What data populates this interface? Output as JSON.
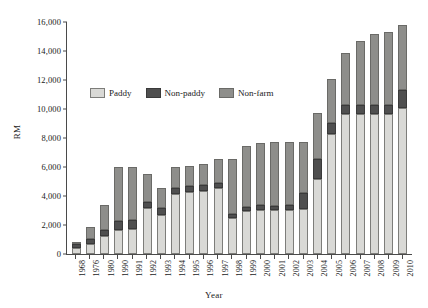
{
  "chart_data": {
    "type": "bar",
    "stacked": true,
    "title": "",
    "xlabel": "Year",
    "ylabel": "RM",
    "ylim": [
      0,
      16000
    ],
    "ytick_step": 2000,
    "yticks": [
      "16,000",
      "14,000",
      "12,000",
      "10,000",
      "8,000",
      "6,000",
      "4,000",
      "2,000",
      "0"
    ],
    "ytick_values": [
      16000,
      14000,
      12000,
      10000,
      8000,
      6000,
      4000,
      2000,
      0
    ],
    "grid": false,
    "legend_position": "upper-left-inside",
    "categories": [
      "1968",
      "1976",
      "1980",
      "1990",
      "1991",
      "1992",
      "1993",
      "1994",
      "1995",
      "1996",
      "1997",
      "1998",
      "1999",
      "2000",
      "2001",
      "2002",
      "2003",
      "2004",
      "2005",
      "2006",
      "2007",
      "2008",
      "2009",
      "2010"
    ],
    "series": [
      {
        "name": "Paddy",
        "color": "#d9d9d6",
        "values": [
          420,
          700,
          1250,
          1650,
          1750,
          3150,
          2650,
          4150,
          4250,
          4300,
          4500,
          2450,
          2950,
          3050,
          3000,
          3050,
          3100,
          5150,
          8250,
          9600,
          9600,
          9600,
          9600,
          10000
        ]
      },
      {
        "name": "Non-paddy",
        "color": "#4f4f4f",
        "values": [
          250,
          300,
          430,
          600,
          600,
          400,
          500,
          400,
          400,
          450,
          350,
          300,
          300,
          350,
          300,
          350,
          1100,
          1350,
          750,
          600,
          600,
          600,
          600,
          1250
        ]
      },
      {
        "name": "Non-farm",
        "color": "#8e8e8b",
        "values": [
          130,
          850,
          1720,
          3750,
          3650,
          1950,
          1350,
          1450,
          1400,
          1450,
          1700,
          3750,
          4150,
          4200,
          4400,
          4300,
          3500,
          3200,
          3000,
          3600,
          4400,
          4900,
          5050,
          4500
        ]
      }
    ],
    "totals": [
      800,
      1850,
      3400,
      6000,
      6000,
      5500,
      4500,
      6000,
      6050,
      6200,
      6550,
      6500,
      7400,
      7600,
      7700,
      7700,
      7700,
      9700,
      12000,
      13800,
      14600,
      15100,
      15250,
      15750
    ]
  },
  "legend": {
    "items": [
      {
        "label": "Paddy",
        "swatch": "paddy-swatch"
      },
      {
        "label": "Non-paddy",
        "swatch": "non-paddy-swatch"
      },
      {
        "label": "Non-farm",
        "swatch": "non-farm-swatch"
      }
    ]
  },
  "colors": {
    "paddy": "#d9d9d6",
    "non_paddy": "#4f4f4f",
    "non_farm": "#8e8e8b",
    "axis": "#4a4a4a",
    "text": "#1a1a1a",
    "background": "#ffffff"
  }
}
